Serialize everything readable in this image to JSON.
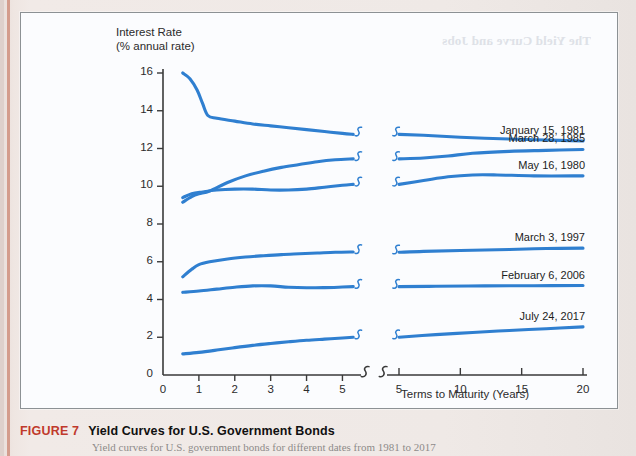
{
  "figure": {
    "number": "FIGURE 7",
    "title": "Yield Curves for U.S. Government Bonds",
    "subtitle": "Yield curves for U.S. government bonds for different dates from 1981 to 2017",
    "bleed_through_text": "The Yield Curve and Jobs"
  },
  "chart_data": {
    "type": "line",
    "title": "Yield Curves for U.S. Government Bonds",
    "ylabel": "Interest Rate",
    "ylabel_sub": "(% annual rate)",
    "xlabel": "Terms to Maturity (Years)",
    "ylim": [
      0,
      16
    ],
    "yticks": [
      0,
      2,
      4,
      6,
      8,
      10,
      12,
      14,
      16
    ],
    "xticks_left": [
      0,
      1,
      2,
      3,
      4,
      5
    ],
    "xticks_right": [
      5,
      10,
      15,
      20
    ],
    "axis_break": true,
    "grid": false,
    "legend_position": "right-inline",
    "line_color": "#2f7fd0",
    "series": [
      {
        "name": "January 15, 1981",
        "points_left": [
          [
            0.55,
            16.0
          ],
          [
            0.75,
            15.7
          ],
          [
            0.95,
            15.1
          ],
          [
            1.1,
            14.4
          ],
          [
            1.25,
            13.75
          ],
          [
            1.5,
            13.6
          ],
          [
            2.0,
            13.45
          ],
          [
            2.5,
            13.3
          ],
          [
            3.0,
            13.2
          ],
          [
            3.5,
            13.1
          ],
          [
            4.0,
            13.0
          ],
          [
            4.5,
            12.9
          ],
          [
            5.0,
            12.8
          ],
          [
            5.3,
            12.75
          ]
        ],
        "points_right": [
          [
            5.0,
            12.75
          ],
          [
            7.0,
            12.7
          ],
          [
            10.0,
            12.6
          ],
          [
            14.0,
            12.5
          ],
          [
            17.0,
            12.45
          ],
          [
            20.0,
            12.4
          ]
        ]
      },
      {
        "name": "March 28, 1985",
        "points_left": [
          [
            0.55,
            9.15
          ],
          [
            0.8,
            9.45
          ],
          [
            1.0,
            9.6
          ],
          [
            1.3,
            9.75
          ],
          [
            1.8,
            10.2
          ],
          [
            2.3,
            10.55
          ],
          [
            2.8,
            10.8
          ],
          [
            3.3,
            11.0
          ],
          [
            3.8,
            11.15
          ],
          [
            4.3,
            11.3
          ],
          [
            4.8,
            11.4
          ],
          [
            5.3,
            11.45
          ]
        ],
        "points_right": [
          [
            5.0,
            11.45
          ],
          [
            7.0,
            11.5
          ],
          [
            9.0,
            11.6
          ],
          [
            11.0,
            11.75
          ],
          [
            14.0,
            11.85
          ],
          [
            17.0,
            11.9
          ],
          [
            20.0,
            11.95
          ]
        ]
      },
      {
        "name": "May 16, 1980",
        "points_left": [
          [
            0.55,
            9.4
          ],
          [
            0.8,
            9.6
          ],
          [
            1.1,
            9.7
          ],
          [
            1.5,
            9.8
          ],
          [
            2.0,
            9.85
          ],
          [
            2.5,
            9.85
          ],
          [
            3.0,
            9.8
          ],
          [
            3.5,
            9.8
          ],
          [
            4.0,
            9.85
          ],
          [
            4.5,
            9.95
          ],
          [
            5.0,
            10.05
          ],
          [
            5.3,
            10.1
          ]
        ],
        "points_right": [
          [
            5.0,
            10.1
          ],
          [
            7.0,
            10.3
          ],
          [
            9.0,
            10.5
          ],
          [
            11.0,
            10.6
          ],
          [
            13.0,
            10.6
          ],
          [
            16.0,
            10.55
          ],
          [
            20.0,
            10.55
          ]
        ]
      },
      {
        "name": "March 3, 1997",
        "points_left": [
          [
            0.55,
            5.2
          ],
          [
            0.8,
            5.6
          ],
          [
            1.0,
            5.85
          ],
          [
            1.3,
            6.0
          ],
          [
            1.8,
            6.15
          ],
          [
            2.3,
            6.25
          ],
          [
            2.8,
            6.32
          ],
          [
            3.3,
            6.38
          ],
          [
            3.8,
            6.42
          ],
          [
            4.3,
            6.46
          ],
          [
            4.8,
            6.5
          ],
          [
            5.3,
            6.52
          ]
        ],
        "points_right": [
          [
            5.0,
            6.5
          ],
          [
            7.0,
            6.55
          ],
          [
            10.0,
            6.6
          ],
          [
            14.0,
            6.65
          ],
          [
            17.0,
            6.7
          ],
          [
            20.0,
            6.72
          ]
        ]
      },
      {
        "name": "February 6, 2006",
        "points_left": [
          [
            0.55,
            4.38
          ],
          [
            1.0,
            4.45
          ],
          [
            1.5,
            4.55
          ],
          [
            2.0,
            4.65
          ],
          [
            2.5,
            4.72
          ],
          [
            3.0,
            4.72
          ],
          [
            3.5,
            4.65
          ],
          [
            4.0,
            4.62
          ],
          [
            4.5,
            4.63
          ],
          [
            5.0,
            4.66
          ],
          [
            5.3,
            4.68
          ]
        ],
        "points_right": [
          [
            5.0,
            4.68
          ],
          [
            8.0,
            4.7
          ],
          [
            12.0,
            4.72
          ],
          [
            16.0,
            4.73
          ],
          [
            20.0,
            4.74
          ]
        ]
      },
      {
        "name": "July 24, 2017",
        "points_left": [
          [
            0.55,
            1.12
          ],
          [
            1.0,
            1.2
          ],
          [
            1.5,
            1.32
          ],
          [
            2.0,
            1.45
          ],
          [
            2.5,
            1.57
          ],
          [
            3.0,
            1.67
          ],
          [
            3.5,
            1.76
          ],
          [
            4.0,
            1.84
          ],
          [
            4.5,
            1.9
          ],
          [
            5.0,
            1.96
          ],
          [
            5.3,
            2.0
          ]
        ],
        "points_right": [
          [
            5.0,
            2.0
          ],
          [
            8.0,
            2.14
          ],
          [
            11.0,
            2.25
          ],
          [
            14.0,
            2.36
          ],
          [
            17.0,
            2.45
          ],
          [
            20.0,
            2.55
          ]
        ]
      }
    ]
  }
}
